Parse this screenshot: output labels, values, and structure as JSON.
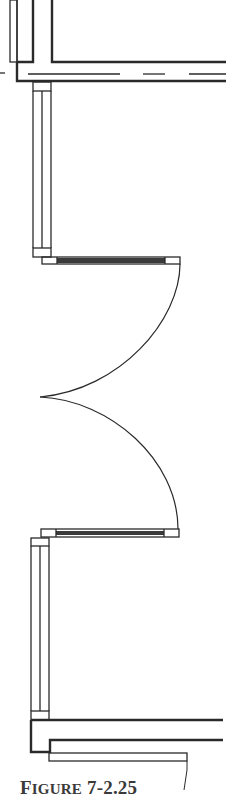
{
  "figure": {
    "caption_prefix": "F",
    "caption_smallcaps": "IGURE",
    "caption_number": " 7-2.25",
    "caption_full": "FIGURE 7-2.25"
  },
  "colors": {
    "line": "#2a2a2a",
    "fill_dark": "#3a3a3a",
    "background": "#ffffff"
  },
  "elements": {
    "top_wall": "horizontal exterior wall with dashed centerline",
    "upper_window": "vertical window in wall",
    "upper_door": "upper door leaf with swing arc",
    "lower_door": "lower door leaf with swing arc",
    "lower_window": "vertical window in wall",
    "bottom_wall": "horizontal exterior wall with sill"
  }
}
